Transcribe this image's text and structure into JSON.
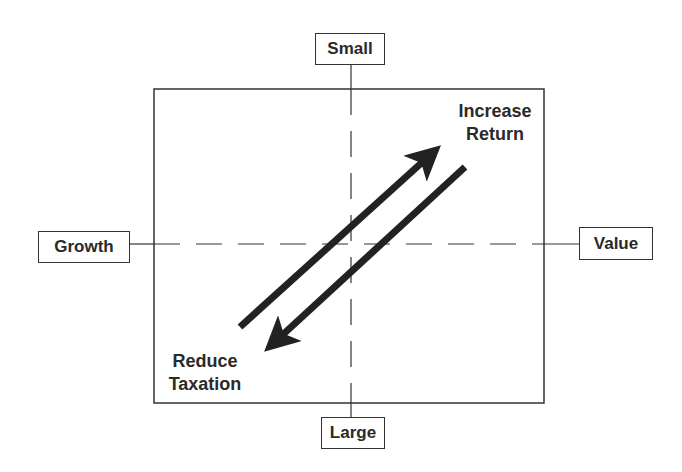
{
  "diagram": {
    "type": "style-box quadrant diagram",
    "axes": {
      "top": {
        "label": "Small"
      },
      "bottom": {
        "label": "Large"
      },
      "left": {
        "label": "Growth"
      },
      "right": {
        "label": "Value"
      }
    },
    "arrows": [
      {
        "direction": "up-right",
        "label_line1": "Increase",
        "label_line2": "Return"
      },
      {
        "direction": "down-left",
        "label_line1": "Reduce",
        "label_line2": "Taxation"
      }
    ],
    "colors": {
      "line": "#333333",
      "arrow": "#222222",
      "text": "#2a2a2a",
      "background": "#ffffff"
    }
  }
}
